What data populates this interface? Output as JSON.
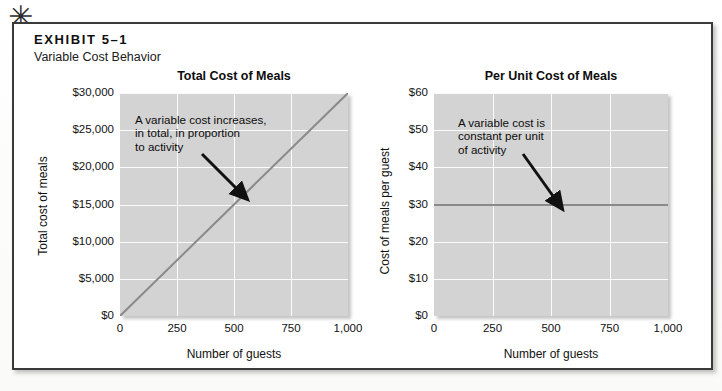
{
  "page": {
    "mark_icon": "asterisk-icon",
    "mark_glyph": "✳"
  },
  "exhibit": {
    "label": "EXHIBIT  5–1",
    "subtitle": "Variable Cost Behavior"
  },
  "colors": {
    "plot_background": "#d3d3d3",
    "gridline": "#fbfbfb",
    "series": "#8a8a8a",
    "frame": "#3a3a3a",
    "arrow": "#111111",
    "text": "#111111"
  },
  "chart_data": [
    {
      "type": "line",
      "title": "Total Cost of Meals",
      "xlabel": "Number of guests",
      "ylabel": "Total cost of meals",
      "x": [
        0,
        1000
      ],
      "values": [
        0,
        30000
      ],
      "xlim": [
        0,
        1000
      ],
      "ylim": [
        0,
        30000
      ],
      "xticks": [
        0,
        250,
        500,
        750,
        1000
      ],
      "xticklabels": [
        "0",
        "250",
        "500",
        "750",
        "1,000"
      ],
      "yticks": [
        0,
        5000,
        10000,
        15000,
        20000,
        25000,
        30000
      ],
      "yticklabels": [
        "$0",
        "$5,000",
        "$10,000",
        "$15,000",
        "$20,000",
        "$25,000",
        "$30,000"
      ],
      "grid": true,
      "legend": "none",
      "annotation": "A variable cost increases,\nin total, in proportion\nto activity"
    },
    {
      "type": "line",
      "title": "Per Unit Cost of Meals",
      "xlabel": "Number of guests",
      "ylabel": "Cost of meals per guest",
      "x": [
        0,
        1000
      ],
      "values": [
        30,
        30
      ],
      "xlim": [
        0,
        1000
      ],
      "ylim": [
        0,
        60
      ],
      "xticks": [
        0,
        250,
        500,
        750,
        1000
      ],
      "xticklabels": [
        "0",
        "250",
        "500",
        "750",
        "1,000"
      ],
      "yticks": [
        0,
        10,
        20,
        30,
        40,
        50,
        60
      ],
      "yticklabels": [
        "$0",
        "$10",
        "$20",
        "$30",
        "$40",
        "$50",
        "$60"
      ],
      "grid": true,
      "legend": "none",
      "annotation": "A variable cost is\nconstant per unit\nof activity"
    }
  ]
}
